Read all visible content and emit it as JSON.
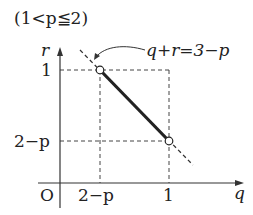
{
  "condition_label": "(1<p≦2)",
  "line_equation_label": "q+r=3−p",
  "axes": {
    "x_axis_label": "q",
    "y_axis_label": "r",
    "origin_label": "O",
    "x_ticks": [
      "2−p",
      "1"
    ],
    "y_ticks": [
      "1",
      "2−p"
    ]
  },
  "segment": {
    "start_point": {
      "q": "2−p",
      "r": "1",
      "marker": "open-circle"
    },
    "end_point": {
      "q": "1",
      "r": "2−p",
      "marker": "open-circle"
    },
    "style": "solid-thick"
  },
  "extended_line": {
    "equation": "q+r=3−p",
    "style": "dashed"
  },
  "colors": {
    "ink": "#222222",
    "background": "#ffffff",
    "guide": "#444444"
  }
}
